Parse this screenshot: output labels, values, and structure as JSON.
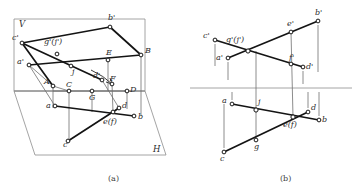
{
  "figure": {
    "title_a": "(a)",
    "title_b": "(b)",
    "stroke_colors": {
      "plane_outline": "#8d8d8d",
      "object_line": "#141414",
      "projector": "#6f6f6f",
      "axis": "#8d8d8d",
      "label_text": "#2b2b2b"
    }
  },
  "panel_a": {
    "name": "pictorial-view",
    "caption": "(a)",
    "plane_labels": [
      {
        "id": "v-plane-label",
        "text": "V",
        "x": 19,
        "y": 27
      },
      {
        "id": "h-plane-label",
        "text": "H",
        "x": 153,
        "y": 152
      }
    ],
    "points": [
      {
        "id": "c-prime",
        "text": "c'",
        "px": 22,
        "py": 43,
        "lx": 12,
        "ly": 40
      },
      {
        "id": "a-prime",
        "text": "a'",
        "px": 29,
        "py": 65,
        "lx": 17,
        "ly": 64
      },
      {
        "id": "b-prime",
        "text": "b'",
        "px": 110,
        "py": 27,
        "lx": 108,
        "ly": 20
      },
      {
        "id": "g-prime-j-prime",
        "text": "g'(j')",
        "px": 57,
        "py": 54,
        "lx": 44,
        "ly": 44
      },
      {
        "id": "j-point",
        "text": "j",
        "px": 71,
        "py": 66,
        "lx": 72,
        "ly": 72
      },
      {
        "id": "E-point",
        "text": "E",
        "px": 108,
        "py": 60,
        "lx": 109,
        "ly": 55
      },
      {
        "id": "B-point",
        "text": "B",
        "px": 141,
        "py": 55,
        "lx": 144,
        "ly": 53
      },
      {
        "id": "d-prime",
        "text": "d'",
        "px": 102,
        "py": 80,
        "lx": 95,
        "ly": 77
      },
      {
        "id": "F-point",
        "text": "F",
        "px": 112,
        "py": 84,
        "lx": 111,
        "ly": 82
      },
      {
        "id": "A-point",
        "text": "A",
        "px": 53,
        "py": 86,
        "lx": 45,
        "ly": 83
      },
      {
        "id": "C-point",
        "text": "C",
        "px": 69,
        "py": 91,
        "lx": 71,
        "ly": 86
      },
      {
        "id": "G-point",
        "text": "G",
        "px": 92,
        "py": 91,
        "lx": 92,
        "ly": 99
      },
      {
        "id": "D-point",
        "text": "D",
        "px": 127,
        "py": 91,
        "lx": 130,
        "ly": 91
      },
      {
        "id": "a-point",
        "text": "a",
        "px": 55,
        "py": 106,
        "lx": 47,
        "ly": 107
      },
      {
        "id": "d-point",
        "text": "d",
        "px": 119,
        "py": 108,
        "lx": 123,
        "ly": 108
      },
      {
        "id": "b-point",
        "text": "b",
        "px": 134,
        "py": 116,
        "lx": 138,
        "ly": 118
      },
      {
        "id": "ef-point",
        "text": "e(f)",
        "px": 113,
        "py": 112,
        "lx": 106,
        "ly": 122
      },
      {
        "id": "c-point",
        "text": "c",
        "px": 68,
        "py": 141,
        "lx": 64,
        "ly": 145
      }
    ]
  },
  "panel_b": {
    "name": "orthographic-projection-view",
    "caption": "(b)",
    "points": [
      {
        "id": "c-prime",
        "text": "c'",
        "px": 215,
        "py": 40,
        "lx": 204,
        "ly": 38
      },
      {
        "id": "g-prime-j-prime",
        "text": "g'(j')",
        "px": 248,
        "py": 51,
        "lx": 227,
        "ly": 40
      },
      {
        "id": "e-prime",
        "text": "e'",
        "px": 291,
        "py": 32,
        "lx": 288,
        "ly": 25
      },
      {
        "id": "b-prime",
        "text": "b'",
        "px": 318,
        "py": 21,
        "lx": 316,
        "ly": 14
      },
      {
        "id": "a-prime",
        "text": "a'",
        "px": 228,
        "py": 58,
        "lx": 217,
        "ly": 58
      },
      {
        "id": "f-prime",
        "text": "f'",
        "px": 291,
        "py": 64,
        "lx": 293,
        "ly": 59
      },
      {
        "id": "d-prime",
        "text": "d'",
        "px": 303,
        "py": 67,
        "lx": 307,
        "ly": 67
      },
      {
        "id": "a-point",
        "text": "a",
        "px": 232,
        "py": 104,
        "lx": 223,
        "ly": 102
      },
      {
        "id": "j-point",
        "text": "j",
        "px": 256,
        "py": 110,
        "lx": 259,
        "ly": 102
      },
      {
        "id": "d-point",
        "text": "d",
        "px": 308,
        "py": 112,
        "lx": 312,
        "ly": 109
      },
      {
        "id": "ef-point",
        "text": "e(f)",
        "px": 293,
        "py": 117,
        "lx": 285,
        "ly": 126
      },
      {
        "id": "b-point",
        "text": "b",
        "px": 319,
        "py": 120,
        "lx": 323,
        "ly": 120
      },
      {
        "id": "g-point",
        "text": "g",
        "px": 256,
        "py": 140,
        "lx": 256,
        "ly": 147
      },
      {
        "id": "c-point",
        "text": "c",
        "px": 224,
        "py": 152,
        "lx": 221,
        "ly": 159
      }
    ],
    "axis_y": 88
  }
}
